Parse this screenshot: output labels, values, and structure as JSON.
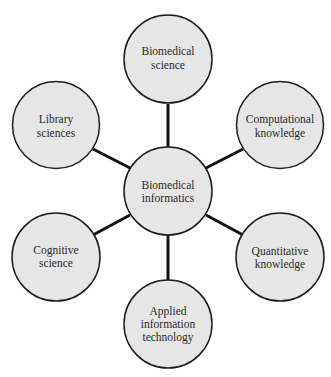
{
  "diagram": {
    "type": "hub-and-spoke",
    "colors": {
      "node_fill": "#e6e6e6",
      "node_stroke": "#1e1e1e",
      "edge": "#111111",
      "text": "#2a2a2a",
      "background": "#ffffff"
    },
    "center": {
      "id": "biomedical-informatics",
      "lines": [
        "Biomedical",
        "informatics"
      ]
    },
    "nodes": [
      {
        "id": "biomedical-science",
        "lines": [
          "Biomedical",
          "science"
        ]
      },
      {
        "id": "computational-knowledge",
        "lines": [
          "Computational",
          "knowledge"
        ]
      },
      {
        "id": "quantitative-knowledge",
        "lines": [
          "Quantitative",
          "knowledge"
        ]
      },
      {
        "id": "applied-information-technology",
        "lines": [
          "Applied",
          "information",
          "technology"
        ]
      },
      {
        "id": "cognitive-science",
        "lines": [
          "Cognitive",
          "science"
        ]
      },
      {
        "id": "library-sciences",
        "lines": [
          "Library",
          "sciences"
        ]
      }
    ],
    "edges": [
      [
        "biomedical-informatics",
        "biomedical-science"
      ],
      [
        "biomedical-informatics",
        "computational-knowledge"
      ],
      [
        "biomedical-informatics",
        "quantitative-knowledge"
      ],
      [
        "biomedical-informatics",
        "applied-information-technology"
      ],
      [
        "biomedical-informatics",
        "cognitive-science"
      ],
      [
        "biomedical-informatics",
        "library-sciences"
      ]
    ]
  }
}
